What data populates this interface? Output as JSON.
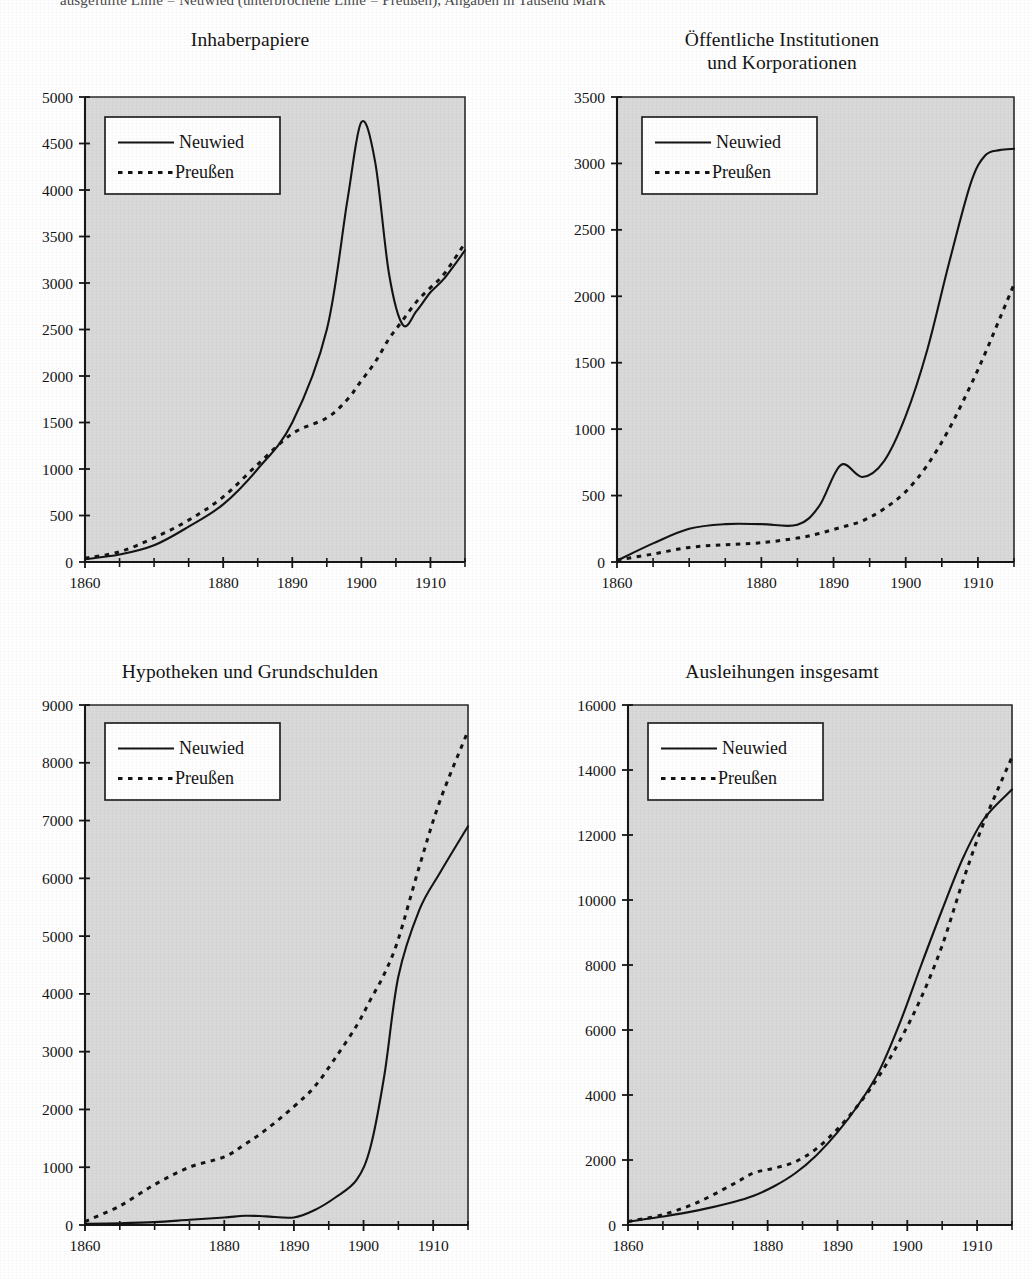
{
  "page": {
    "top_cut_text": "ausgefüllte Linie = Neuwied (unterbrochene Linie = Preußen), Angaben in Tausend Mark"
  },
  "legend": {
    "neuwied": "Neuwied",
    "preussen": "Preußen"
  },
  "chart_data": [
    {
      "type": "line",
      "title": "Inhaberpapiere",
      "xlabel": "",
      "ylabel": "",
      "xlim": [
        1860,
        1915
      ],
      "ylim": [
        0,
        5000
      ],
      "xticks": [
        1860,
        1880,
        1890,
        1900,
        1910
      ],
      "xticks_minor": [
        1865,
        1870,
        1875,
        1885,
        1895,
        1905,
        1915
      ],
      "yticks": [
        0,
        500,
        1000,
        1500,
        2000,
        2500,
        3000,
        3500,
        4000,
        4500,
        5000
      ],
      "grid": false,
      "legend_position": "upper-left",
      "x": [
        1860,
        1865,
        1870,
        1875,
        1880,
        1885,
        1890,
        1895,
        1898,
        1900,
        1902,
        1904,
        1906,
        1908,
        1910,
        1912,
        1915
      ],
      "series": [
        {
          "name": "Neuwied",
          "style": "solid",
          "values": [
            30,
            80,
            180,
            380,
            620,
            1000,
            1500,
            2500,
            3900,
            4730,
            4300,
            3100,
            2550,
            2700,
            2900,
            3050,
            3350
          ]
        },
        {
          "name": "Preußen",
          "style": "dashed",
          "values": [
            40,
            110,
            260,
            450,
            700,
            1050,
            1380,
            1550,
            1750,
            1950,
            2150,
            2400,
            2600,
            2800,
            2950,
            3100,
            3430
          ]
        }
      ]
    },
    {
      "type": "line",
      "title": "Öffentliche Institutionen\nund Korporationen",
      "title_lines": [
        "Öffentliche Institutionen",
        "und Korporationen"
      ],
      "xlabel": "",
      "ylabel": "",
      "xlim": [
        1860,
        1915
      ],
      "ylim": [
        0,
        3500
      ],
      "xticks": [
        1860,
        1880,
        1890,
        1900,
        1910
      ],
      "xticks_minor": [
        1865,
        1870,
        1875,
        1885,
        1895,
        1905,
        1915
      ],
      "yticks": [
        0,
        500,
        1000,
        1500,
        2000,
        2500,
        3000,
        3500
      ],
      "grid": false,
      "legend_position": "upper-left",
      "x": [
        1860,
        1865,
        1870,
        1875,
        1880,
        1885,
        1888,
        1891,
        1894,
        1897,
        1900,
        1903,
        1906,
        1909,
        1911,
        1913,
        1915
      ],
      "series": [
        {
          "name": "Neuwied",
          "style": "solid",
          "values": [
            10,
            140,
            250,
            285,
            285,
            280,
            420,
            730,
            640,
            760,
            1100,
            1600,
            2250,
            2850,
            3060,
            3100,
            3110
          ]
        },
        {
          "name": "Preußen",
          "style": "dashed",
          "values": [
            15,
            60,
            110,
            130,
            145,
            180,
            215,
            260,
            310,
            400,
            530,
            730,
            1000,
            1330,
            1570,
            1830,
            2090
          ]
        }
      ]
    },
    {
      "type": "line",
      "title": "Hypotheken und Grundschulden",
      "xlabel": "",
      "ylabel": "",
      "xlim": [
        1860,
        1915
      ],
      "ylim": [
        0,
        9000
      ],
      "xticks": [
        1860,
        1880,
        1890,
        1900,
        1910
      ],
      "xticks_minor": [
        1865,
        1870,
        1875,
        1885,
        1895,
        1905,
        1915
      ],
      "yticks": [
        0,
        1000,
        2000,
        3000,
        4000,
        5000,
        6000,
        7000,
        8000,
        9000
      ],
      "grid": false,
      "legend_position": "upper-left",
      "x": [
        1860,
        1865,
        1870,
        1875,
        1880,
        1883,
        1886,
        1890,
        1893,
        1896,
        1899,
        1901,
        1903,
        1905,
        1908,
        1911,
        1915
      ],
      "series": [
        {
          "name": "Neuwied",
          "style": "solid",
          "values": [
            20,
            30,
            50,
            90,
            130,
            160,
            150,
            130,
            260,
            480,
            780,
            1350,
            2600,
            4300,
            5450,
            6100,
            6900
          ]
        },
        {
          "name": "Preußen",
          "style": "dashed",
          "values": [
            60,
            330,
            700,
            1000,
            1180,
            1400,
            1650,
            2050,
            2400,
            2900,
            3450,
            3900,
            4350,
            4950,
            6200,
            7350,
            8550
          ]
        }
      ]
    },
    {
      "type": "line",
      "title": "Ausleihungen insgesamt",
      "xlabel": "",
      "ylabel": "",
      "xlim": [
        1860,
        1915
      ],
      "ylim": [
        0,
        16000
      ],
      "xticks": [
        1860,
        1880,
        1890,
        1900,
        1910
      ],
      "xticks_minor": [
        1865,
        1870,
        1875,
        1885,
        1895,
        1905,
        1915
      ],
      "yticks": [
        0,
        2000,
        4000,
        6000,
        8000,
        10000,
        12000,
        14000,
        16000
      ],
      "grid": false,
      "legend_position": "upper-left",
      "x": [
        1860,
        1865,
        1870,
        1875,
        1878,
        1881,
        1884,
        1887,
        1890,
        1893,
        1896,
        1899,
        1902,
        1905,
        1908,
        1911,
        1915
      ],
      "series": [
        {
          "name": "Neuwied",
          "style": "solid",
          "values": [
            100,
            260,
            450,
            700,
            900,
            1200,
            1600,
            2150,
            2850,
            3700,
            4750,
            6250,
            8000,
            9700,
            11300,
            12500,
            13400
          ]
        },
        {
          "name": "Preußen",
          "style": "dashed",
          "values": [
            110,
            320,
            700,
            1250,
            1600,
            1750,
            1950,
            2350,
            2950,
            3700,
            4600,
            5700,
            7000,
            8600,
            10600,
            12400,
            14400
          ]
        }
      ]
    }
  ]
}
